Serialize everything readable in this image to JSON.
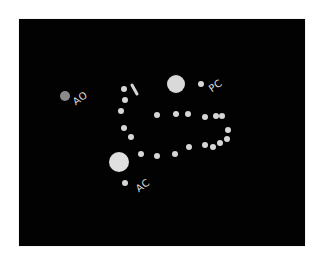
{
  "figure": {
    "background": "#020202",
    "frame": {
      "left": 19,
      "top": 19,
      "width": 286,
      "height": 227
    }
  },
  "landmarks": [
    {
      "id": "AO",
      "label": "AO",
      "x": 65,
      "y": 96,
      "r": 5,
      "color": "#8a8a8a",
      "label_x": 74,
      "label_y": 103
    },
    {
      "id": "PC",
      "label": "PC",
      "x": 176,
      "y": 84,
      "r": 9,
      "color": "#d9d9d9",
      "label_x": 210,
      "label_y": 90
    },
    {
      "id": "AC",
      "label": "AC",
      "x": 119,
      "y": 162,
      "r": 10,
      "color": "#e0e0e0",
      "label_x": 137,
      "label_y": 190
    }
  ],
  "marker_dots": [
    {
      "x": 201,
      "y": 84,
      "r": 3
    },
    {
      "x": 125,
      "y": 183,
      "r": 3
    }
  ],
  "trail_dots": [
    {
      "x": 124,
      "y": 89,
      "r": 3
    },
    {
      "x": 125,
      "y": 100,
      "r": 3
    },
    {
      "x": 121,
      "y": 111,
      "r": 3
    },
    {
      "x": 124,
      "y": 128,
      "r": 3
    },
    {
      "x": 131,
      "y": 137,
      "r": 3
    },
    {
      "x": 141,
      "y": 154,
      "r": 3
    },
    {
      "x": 157,
      "y": 156,
      "r": 3
    },
    {
      "x": 175,
      "y": 154,
      "r": 3
    },
    {
      "x": 189,
      "y": 147,
      "r": 3
    },
    {
      "x": 205,
      "y": 145,
      "r": 3
    },
    {
      "x": 213,
      "y": 147,
      "r": 3
    },
    {
      "x": 220,
      "y": 143,
      "r": 3
    },
    {
      "x": 227,
      "y": 139,
      "r": 3
    },
    {
      "x": 228,
      "y": 130,
      "r": 3
    },
    {
      "x": 222,
      "y": 116,
      "r": 3
    },
    {
      "x": 216,
      "y": 116,
      "r": 3
    },
    {
      "x": 205,
      "y": 117,
      "r": 3
    },
    {
      "x": 188,
      "y": 114,
      "r": 3
    },
    {
      "x": 176,
      "y": 114,
      "r": 3
    },
    {
      "x": 157,
      "y": 115,
      "r": 3
    }
  ],
  "streak": {
    "x1": 132,
    "y1": 85,
    "x2": 137,
    "y2": 94,
    "width": 3
  },
  "dot_color": "#d6d6d6"
}
